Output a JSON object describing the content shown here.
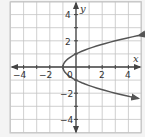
{
  "chart_data": {
    "type": "line",
    "title": "",
    "xlabel": "x",
    "ylabel": "y",
    "xlim": [
      -5,
      5
    ],
    "ylim": [
      -5,
      5
    ],
    "grid": true,
    "x_ticks": [
      -4,
      -2,
      2,
      4
    ],
    "y_ticks": [
      4,
      2,
      -2,
      -4
    ],
    "origin_label": "0",
    "series": [
      {
        "name": "x = y^2 - 1",
        "equation": "x = y^2 - 1",
        "vertex": [
          -1,
          0
        ],
        "y_intercepts": [
          1,
          -1
        ],
        "points": [
          [
            4.8,
            2.4
          ],
          [
            3,
            2
          ],
          [
            0,
            1
          ],
          [
            -0.75,
            0.5
          ],
          [
            -1,
            0
          ],
          [
            -0.75,
            -0.5
          ],
          [
            0,
            -1
          ],
          [
            3,
            -2
          ],
          [
            4.8,
            -2.4
          ]
        ],
        "arrows_at_ends": true
      }
    ]
  },
  "labels": {
    "x_axis": "x",
    "y_axis": "y",
    "origin": "0",
    "xt": [
      "−4",
      "−2",
      "2",
      "4"
    ],
    "yt": [
      "4",
      "2",
      "−2",
      "−4"
    ]
  },
  "colors": {
    "background": "#f4f4f4",
    "plot_bg": "#ffffff",
    "grid": "#c4c4c4",
    "axis": "#444444",
    "curve": "#555555"
  }
}
